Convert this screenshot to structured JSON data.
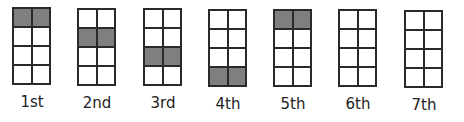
{
  "diagram": {
    "colors": {
      "shaded": "#7f7f7f",
      "empty": "#ffffff",
      "border": "#2a2a2a"
    },
    "grid": {
      "rows": 4,
      "cols": 2
    },
    "steps": [
      {
        "label": "1st",
        "shaded_row": 0
      },
      {
        "label": "2nd",
        "shaded_row": 1
      },
      {
        "label": "3rd",
        "shaded_row": 2
      },
      {
        "label": "4th",
        "shaded_row": 3
      },
      {
        "label": "5th",
        "shaded_row": 0
      },
      {
        "label": "6th",
        "shaded_row": null
      },
      {
        "label": "7th",
        "shaded_row": null
      }
    ]
  }
}
